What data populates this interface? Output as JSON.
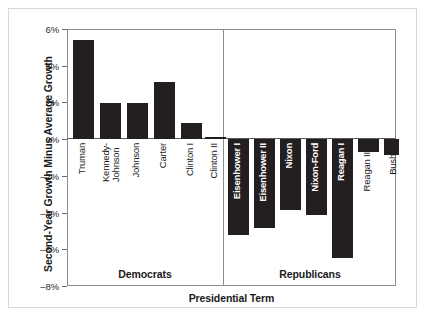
{
  "caption_remnant": " ",
  "chart_data": {
    "type": "bar",
    "title": "",
    "xlabel": "Presidential Term",
    "ylabel": "Second-Year Growth Minus Average Growth",
    "ylim": [
      -8,
      6
    ],
    "ytick_labels": [
      "6%",
      "4%",
      "2%",
      "0%",
      "–2%",
      "–4%",
      "–6%",
      "–8%"
    ],
    "ytick_values": [
      6,
      4,
      2,
      0,
      -2,
      -4,
      -6,
      -8
    ],
    "grid": false,
    "legend": "none",
    "bar_color": "#231f20",
    "axis_color": "#8d8d8d",
    "groups": [
      {
        "name": "Democrats",
        "label": "Democrats"
      },
      {
        "name": "Republicans",
        "label": "Republicans"
      }
    ],
    "categories": [
      "Truman",
      "Kennedy-\nJohnson",
      "Johnson",
      "Carter",
      "Clinton I",
      "Clinton II",
      "Eisenhower I",
      "Eisenhower II",
      "Nixon",
      "Nixon-Ford",
      "Reagan I",
      "Reagan II",
      "Bush"
    ],
    "values": [
      5.4,
      1.95,
      1.95,
      3.1,
      0.9,
      0.1,
      -5.2,
      -4.85,
      -3.85,
      -4.15,
      -6.5,
      -0.7,
      -0.85
    ],
    "bars": [
      {
        "label": "Truman",
        "value": 5.4,
        "group": "Democrats",
        "x": 73,
        "w": 21,
        "label_inside": false,
        "label_top": 143
      },
      {
        "label": "Kennedy-\nJohnson",
        "value": 1.95,
        "group": "Democrats",
        "x": 100,
        "w": 21,
        "label_inside": false,
        "label_top": 143
      },
      {
        "label": "Johnson",
        "value": 1.95,
        "group": "Democrats",
        "x": 127,
        "w": 21,
        "label_inside": false,
        "label_top": 143
      },
      {
        "label": "Carter",
        "value": 3.1,
        "group": "Democrats",
        "x": 154,
        "w": 21,
        "label_inside": false,
        "label_top": 143
      },
      {
        "label": "Clinton I",
        "value": 0.9,
        "group": "Democrats",
        "x": 181,
        "w": 21,
        "label_inside": false,
        "label_top": 143
      },
      {
        "label": "Clinton II",
        "value": 0.1,
        "group": "Democrats",
        "x": 205,
        "w": 21,
        "label_inside": false,
        "label_top": 143
      },
      {
        "label": "Eisenhower I",
        "value": -5.2,
        "group": "Republicans",
        "x": 228,
        "w": 21,
        "label_inside": true,
        "label_top": 143
      },
      {
        "label": "Eisenhower II",
        "value": -4.85,
        "group": "Republicans",
        "x": 254,
        "w": 21,
        "label_inside": true,
        "label_top": 143
      },
      {
        "label": "Nixon",
        "value": -3.85,
        "group": "Republicans",
        "x": 280,
        "w": 21,
        "label_inside": true,
        "label_top": 143
      },
      {
        "label": "Nixon-Ford",
        "value": -4.15,
        "group": "Republicans",
        "x": 306,
        "w": 21,
        "label_inside": true,
        "label_top": 143
      },
      {
        "label": "Reagan I",
        "value": -6.5,
        "group": "Republicans",
        "x": 332,
        "w": 21,
        "label_inside": true,
        "label_top": 143
      },
      {
        "label": "Reagan II",
        "value": -0.7,
        "group": "Republicans",
        "x": 358,
        "w": 21,
        "label_inside": false,
        "label_top": 152
      },
      {
        "label": "Bush",
        "value": -0.85,
        "group": "Republicans",
        "x": 384,
        "w": 15,
        "label_inside": false,
        "label_top": 154
      }
    ]
  }
}
